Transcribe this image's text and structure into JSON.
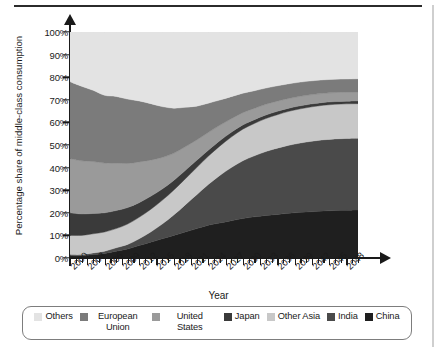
{
  "chart_data": {
    "type": "area",
    "stacked": true,
    "normalized": true,
    "title": "",
    "xlabel": "Year",
    "ylabel": "Percentage share of middle-class consumption",
    "xlim": [
      2000,
      2050
    ],
    "ylim": [
      0,
      100
    ],
    "grid": false,
    "legend_position": "bottom",
    "y_ticks": [
      "0%",
      "10%",
      "20%",
      "30%",
      "40%",
      "50%",
      "60%",
      "70%",
      "80%",
      "90%",
      "100%"
    ],
    "y_tick_values": [
      0,
      10,
      20,
      30,
      40,
      50,
      60,
      70,
      80,
      90,
      100
    ],
    "x_tick_labels": [
      "2000",
      "2003",
      "2006",
      "2009",
      "2012",
      "2015",
      "2018",
      "2021",
      "2024",
      "2027",
      "2030",
      "2033",
      "2036",
      "2039",
      "2042",
      "2045",
      "2048"
    ],
    "x_tick_values": [
      2000,
      2003,
      2006,
      2009,
      2012,
      2015,
      2018,
      2021,
      2024,
      2027,
      2030,
      2033,
      2036,
      2039,
      2042,
      2045,
      2048
    ],
    "x_minor_tick_step": 1,
    "x": [
      2000,
      2002,
      2004,
      2006,
      2008,
      2010,
      2012,
      2014,
      2016,
      2018,
      2020,
      2022,
      2024,
      2026,
      2028,
      2030,
      2032,
      2034,
      2036,
      2038,
      2040,
      2042,
      2044,
      2046,
      2048,
      2050
    ],
    "stack_order_bottom_to_top": [
      "China",
      "India",
      "Other Asia",
      "Japan",
      "United States",
      "European Union",
      "Others"
    ],
    "series": [
      {
        "name": "China",
        "color": "#1f1f1f",
        "values": [
          1,
          1,
          1.5,
          2,
          3,
          4,
          5.5,
          7,
          8.5,
          10,
          11.5,
          13,
          14.5,
          15.5,
          16.5,
          17.5,
          18.2,
          18.8,
          19.3,
          19.8,
          20.2,
          20.5,
          20.8,
          21,
          21.1,
          21.2
        ]
      },
      {
        "name": "India",
        "color": "#4a4a4a",
        "values": [
          0.5,
          0.5,
          0.7,
          1,
          1.5,
          2,
          3,
          4.5,
          6.5,
          9,
          12,
          15,
          18,
          21,
          23.5,
          25.5,
          27,
          28.3,
          29.3,
          30.1,
          30.7,
          31.2,
          31.5,
          31.7,
          31.8,
          31.8
        ]
      },
      {
        "name": "Other Asia",
        "color": "#c8c8c8",
        "values": [
          8.5,
          8.5,
          8.5,
          8.5,
          8.5,
          9,
          9.5,
          10,
          10.5,
          11,
          11.5,
          12,
          12.5,
          13,
          13.5,
          14,
          14.3,
          14.6,
          14.8,
          15,
          15.1,
          15.2,
          15.3,
          15.3,
          15.3,
          15.3
        ]
      },
      {
        "name": "Japan",
        "color": "#3a3a3a",
        "values": [
          10,
          9.5,
          9,
          8.5,
          8,
          7.3,
          6.5,
          5.8,
          5,
          4.3,
          3.7,
          3.2,
          2.7,
          2.4,
          2.1,
          1.9,
          1.7,
          1.6,
          1.5,
          1.4,
          1.35,
          1.3,
          1.25,
          1.2,
          1.2,
          1.2
        ]
      },
      {
        "name": "United States",
        "color": "#9a9a9a",
        "values": [
          24,
          23.5,
          23,
          22,
          21,
          19.5,
          18,
          16,
          14,
          12,
          10.5,
          9,
          7.8,
          6.8,
          6,
          5.4,
          5,
          4.7,
          4.5,
          4.3,
          4.2,
          4.1,
          4,
          4,
          4,
          4
        ]
      },
      {
        "name": "European Union",
        "color": "#7b7b7b",
        "values": [
          34,
          33,
          31.5,
          30,
          29.5,
          28.5,
          27,
          25,
          22.5,
          20,
          17.5,
          15,
          13,
          11.2,
          9.8,
          8.6,
          7.8,
          7.2,
          6.8,
          6.5,
          6.3,
          6.1,
          6,
          5.9,
          5.8,
          5.8
        ]
      },
      {
        "name": "Others",
        "color": "#e3e3e3",
        "values": [
          22,
          24,
          25.8,
          28,
          28.5,
          29.7,
          30.5,
          31.7,
          33,
          33.7,
          33.3,
          32.8,
          31.5,
          30.1,
          28.6,
          27.1,
          26,
          24.8,
          23.8,
          22.9,
          22.15,
          21.6,
          21.15,
          20.9,
          20.8,
          20.7
        ]
      }
    ]
  },
  "axis": {
    "y_title": "Percentage share of middle-class consumption",
    "x_title": "Year"
  },
  "legend": {
    "items": [
      {
        "label": "Others",
        "color": "#e3e3e3"
      },
      {
        "label": "European Union",
        "color": "#7b7b7b"
      },
      {
        "label": "United States",
        "color": "#9a9a9a"
      },
      {
        "label": "Japan",
        "color": "#3a3a3a"
      },
      {
        "label": "Other Asia",
        "color": "#c8c8c8"
      },
      {
        "label": "India",
        "color": "#4a4a4a"
      },
      {
        "label": "China",
        "color": "#1f1f1f"
      }
    ]
  }
}
